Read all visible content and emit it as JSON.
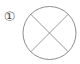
{
  "figure": {
    "background_color": "#ffffff",
    "stroke_color": "#808080",
    "label_color": "#4a4a4a",
    "item_label": "①",
    "item_number": "1",
    "caption": "",
    "shape_name": "circle-with-x",
    "geometry": {
      "circle": {
        "cx": 49.5,
        "cy": 33,
        "r": 26.5,
        "stroke_width": 0.9
      },
      "diagonals": [
        {
          "x1": 30.8,
          "y1": 14.3,
          "x2": 68.2,
          "y2": 51.7
        },
        {
          "x1": 68.2,
          "y1": 14.3,
          "x2": 30.8,
          "y2": 51.7
        }
      ],
      "label_position": {
        "x": 9.5,
        "y": 17
      }
    }
  }
}
